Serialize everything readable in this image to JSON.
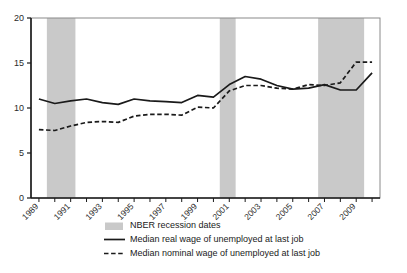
{
  "chart_data": {
    "type": "line",
    "title": "",
    "subtitle": "",
    "xlabel": "",
    "ylabel": "",
    "ylim": [
      0,
      20
    ],
    "xlim": [
      1988.5,
      2010.5
    ],
    "yticks": [
      "0",
      "5",
      "10",
      "15",
      "20"
    ],
    "ytick_values": [
      0,
      5,
      10,
      15,
      20
    ],
    "xticks": [
      "1989",
      "1991",
      "1993",
      "1995",
      "1997",
      "1999",
      "2001",
      "2003",
      "2005",
      "2007",
      "2009"
    ],
    "xtick_values": [
      1989,
      1991,
      1993,
      1995,
      1997,
      1999,
      2001,
      2003,
      2005,
      2007,
      2009
    ],
    "xtick_rotation": 45,
    "grid": false,
    "legend_position": "below",
    "x": [
      1989,
      1990,
      1991,
      1992,
      1993,
      1994,
      1995,
      1996,
      1997,
      1998,
      1999,
      2000,
      2001,
      2002,
      2003,
      2004,
      2005,
      2006,
      2007,
      2008,
      2009,
      2010
    ],
    "series": [
      {
        "name": "Median real wage of unemployed at last job",
        "style": "solid",
        "color": "#1a1a1a",
        "values": [
          11.0,
          10.5,
          10.8,
          11.0,
          10.6,
          10.4,
          11.0,
          10.8,
          10.7,
          10.6,
          11.4,
          11.2,
          12.6,
          13.5,
          13.2,
          12.5,
          12.1,
          12.2,
          12.6,
          12.0,
          12.0,
          13.9
        ]
      },
      {
        "name": "Median nominal wage of unemployed at last job",
        "style": "dashed",
        "color": "#1a1a1a",
        "values": [
          7.6,
          7.5,
          8.0,
          8.4,
          8.5,
          8.4,
          9.1,
          9.3,
          9.3,
          9.2,
          10.1,
          10.0,
          11.9,
          12.5,
          12.5,
          12.2,
          12.1,
          12.6,
          12.5,
          12.8,
          15.1,
          15.1
        ]
      }
    ],
    "shaded_regions": {
      "label": "NBER recession dates",
      "color": "#c9c9c9",
      "spans": [
        {
          "start": 1989.5,
          "end": 1991.3
        },
        {
          "start": 2000.4,
          "end": 2001.4
        },
        {
          "start": 2006.6,
          "end": 2009.5
        }
      ]
    }
  },
  "legend": {
    "items": [
      {
        "label": "NBER recession dates",
        "marker": "swatch"
      },
      {
        "label": "Median real wage of unemployed at last job",
        "marker": "solid-line"
      },
      {
        "label": "Median nominal wage of unemployed at last job",
        "marker": "dashed-line"
      }
    ]
  }
}
